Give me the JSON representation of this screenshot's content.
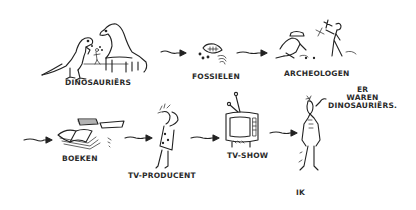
{
  "diagram": {
    "type": "illustrated-chain",
    "nodes": [
      {
        "id": "dinosaurs",
        "label": "DINOSAURIËRS",
        "icon": "dinosaurs-icon"
      },
      {
        "id": "fossils",
        "label": "FOSSIELEN",
        "icon": "fossil-icon"
      },
      {
        "id": "archaeologists",
        "label": "ARCHEOLOGEN",
        "icon": "archaeologists-icon"
      },
      {
        "id": "books",
        "label": "BOEKEN",
        "icon": "books-icon"
      },
      {
        "id": "tv_producer",
        "label": "TV-PRODUCENT",
        "icon": "tv-producer-icon"
      },
      {
        "id": "tv_show",
        "label": "TV-SHOW",
        "icon": "television-icon"
      },
      {
        "id": "me",
        "label": "IK",
        "icon": "person-icon"
      }
    ],
    "edges": [
      {
        "from": "dinosaurs",
        "to": "fossils"
      },
      {
        "from": "fossils",
        "to": "archaeologists"
      },
      {
        "from": "archaeologists",
        "to": "books"
      },
      {
        "from": "books",
        "to": "tv_producer"
      },
      {
        "from": "tv_producer",
        "to": "tv_show"
      },
      {
        "from": "tv_show",
        "to": "me"
      }
    ],
    "speech": {
      "line1": "ER",
      "line2": "WAREN",
      "line3": "DINOSAURIËRS."
    }
  }
}
